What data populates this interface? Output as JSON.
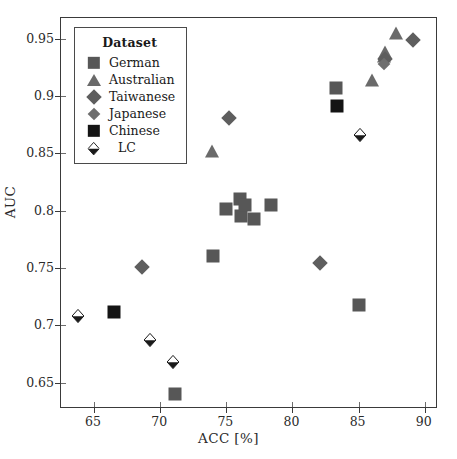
{
  "chart_data": {
    "type": "scatter",
    "title": "",
    "xlabel": "ACC [%]",
    "ylabel": "AUC",
    "xlim": [
      62.5,
      91.0
    ],
    "ylim": [
      0.627,
      0.968
    ],
    "xticks": [
      65,
      70,
      75,
      80,
      85,
      90
    ],
    "yticks": [
      0.65,
      0.7,
      0.75,
      0.8,
      0.85,
      0.9,
      0.95
    ],
    "xtick_labels": [
      "65",
      "70",
      "75",
      "80",
      "85",
      "90"
    ],
    "ytick_labels": [
      "0.65",
      "0.7",
      "0.75",
      "0.8",
      "0.85",
      "0.9",
      "0.95"
    ],
    "grid": false,
    "legend_position": "upper-left",
    "legend_title": "Dataset",
    "series": [
      {
        "name": "German",
        "marker": "square",
        "color": "#575757",
        "points": [
          {
            "x": 71.1,
            "y": 0.64
          },
          {
            "x": 74.0,
            "y": 0.76
          },
          {
            "x": 75.0,
            "y": 0.801
          },
          {
            "x": 76.0,
            "y": 0.81
          },
          {
            "x": 76.1,
            "y": 0.795
          },
          {
            "x": 76.4,
            "y": 0.805
          },
          {
            "x": 77.1,
            "y": 0.793
          },
          {
            "x": 78.4,
            "y": 0.805
          },
          {
            "x": 83.3,
            "y": 0.907
          },
          {
            "x": 85.0,
            "y": 0.718
          }
        ]
      },
      {
        "name": "Australian",
        "marker": "triangle",
        "color": "#6a6a6a",
        "points": [
          {
            "x": 73.9,
            "y": 0.852
          },
          {
            "x": 86.0,
            "y": 0.914
          },
          {
            "x": 86.9,
            "y": 0.935
          },
          {
            "x": 87.0,
            "y": 0.938
          },
          {
            "x": 87.8,
            "y": 0.955
          }
        ]
      },
      {
        "name": "Taiwanese",
        "marker": "diamond",
        "color": "#5e5e5e",
        "points": [
          {
            "x": 68.6,
            "y": 0.751
          },
          {
            "x": 75.2,
            "y": 0.881
          },
          {
            "x": 82.1,
            "y": 0.754
          },
          {
            "x": 87.0,
            "y": 0.932
          },
          {
            "x": 89.1,
            "y": 0.949
          }
        ]
      },
      {
        "name": "Japanese",
        "marker": "diamond-small",
        "color": "#6e6e6e",
        "points": [
          {
            "x": 86.9,
            "y": 0.928
          }
        ]
      },
      {
        "name": "Chinese",
        "marker": "square-filled",
        "color": "#141414",
        "points": [
          {
            "x": 66.5,
            "y": 0.712
          },
          {
            "x": 83.4,
            "y": 0.891
          }
        ]
      },
      {
        "name": "LC",
        "marker": "half-diamond",
        "color": "#ffffff",
        "edge_color": "#1a1a1a",
        "points": [
          {
            "x": 63.8,
            "y": 0.709
          },
          {
            "x": 69.2,
            "y": 0.688
          },
          {
            "x": 71.0,
            "y": 0.669
          },
          {
            "x": 85.1,
            "y": 0.867
          }
        ]
      }
    ]
  },
  "legend": {
    "title": "Dataset",
    "items": [
      {
        "label": "German",
        "marker": "square",
        "color": "#575757"
      },
      {
        "label": "Australian",
        "marker": "triangle",
        "color": "#6a6a6a"
      },
      {
        "label": "Taiwanese",
        "marker": "diamond",
        "color": "#5e5e5e"
      },
      {
        "label": "Japanese",
        "marker": "diamond-small",
        "color": "#6e6e6e"
      },
      {
        "label": "Chinese",
        "marker": "square-filled",
        "color": "#141414"
      },
      {
        "label": "LC",
        "marker": "half-diamond",
        "color": "#ffffff"
      }
    ]
  }
}
